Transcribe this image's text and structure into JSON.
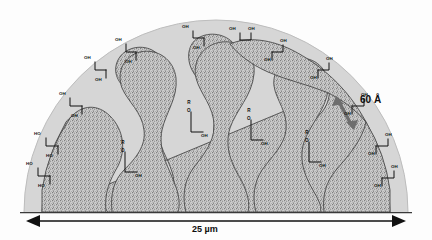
{
  "figure": {
    "type": "schematic-cross-section",
    "core_fill": "#b9b9b9",
    "shell_fill": "#d4d4d4",
    "pore_fill": "#ffffff",
    "outline_color": "#3a3a3a",
    "background": "#fdfdfd"
  },
  "annotations": {
    "pore_size": "60 Å",
    "particle_size": "25 µm"
  },
  "surface_groups": {
    "left_label": "HO",
    "right_label": "OH",
    "top_label": "OH"
  },
  "chain_label": {
    "r": "R",
    "o": "O",
    "oh": "OH"
  },
  "exterior_groups": [
    {
      "id": "eg1",
      "label_a": "HO",
      "label_b": "HO",
      "side": "left",
      "x": 30,
      "y": 168
    },
    {
      "id": "eg2",
      "label_a": "HO",
      "label_b": "HO",
      "side": "left",
      "x": 38,
      "y": 140
    },
    {
      "id": "eg3",
      "label_a": "OH",
      "label_b": "OH",
      "side": "left",
      "x": 63,
      "y": 98
    },
    {
      "id": "eg4",
      "label_a": "OH",
      "label_b": "OH",
      "side": "left",
      "x": 88,
      "y": 62
    },
    {
      "id": "eg5",
      "label_a": "OH",
      "label_b": "OH",
      "side": "left",
      "x": 120,
      "y": 44
    },
    {
      "id": "eg6",
      "label_a": "OH",
      "label_b": "OH",
      "side": "top",
      "x": 196,
      "y": 30
    },
    {
      "id": "eg7",
      "label_a": "OH",
      "label_b": "OH",
      "side": "top",
      "x": 237,
      "y": 32
    },
    {
      "id": "eg8",
      "label_a": "OH",
      "label_b": "OH",
      "side": "right",
      "x": 272,
      "y": 44
    },
    {
      "id": "eg9",
      "label_a": "OH",
      "label_b": "OH",
      "side": "right",
      "x": 316,
      "y": 62
    },
    {
      "id": "eg10",
      "label_a": "OH",
      "label_b": "OH",
      "side": "right",
      "x": 362,
      "y": 98
    },
    {
      "id": "eg11",
      "label_a": "OH",
      "label_b": "OH",
      "side": "right",
      "x": 380,
      "y": 140
    },
    {
      "id": "eg12",
      "label_a": "OH",
      "label_b": "OH",
      "side": "right",
      "x": 388,
      "y": 172
    }
  ],
  "interior_chains": [
    {
      "id": "ic1",
      "x": 188,
      "y": 118
    },
    {
      "id": "ic2",
      "x": 248,
      "y": 126
    },
    {
      "id": "ic3",
      "x": 306,
      "y": 148
    },
    {
      "id": "ic4",
      "x": 122,
      "y": 158
    }
  ]
}
